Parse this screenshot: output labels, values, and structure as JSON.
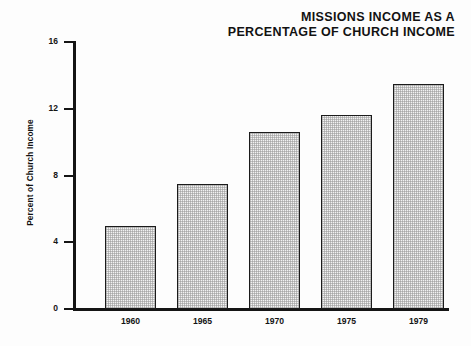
{
  "chart_data": {
    "type": "bar",
    "title": "MISSIONS INCOME AS A PERCENTAGE OF CHURCH INCOME",
    "title_lines": [
      "MISSIONS INCOME AS A",
      "PERCENTAGE OF CHURCH INCOME"
    ],
    "categories": [
      "1960",
      "1965",
      "1970",
      "1975",
      "1979"
    ],
    "values": [
      5.0,
      7.5,
      10.6,
      11.6,
      13.5
    ],
    "xlabel": "",
    "ylabel": "Percent of Church Income",
    "ylim": [
      0,
      16
    ],
    "yticks": [
      0,
      4,
      8,
      12,
      16
    ],
    "ytick_labels": [
      "0",
      "4",
      "8",
      "12",
      "16"
    ],
    "grid": false,
    "legend": false,
    "bar_fill_color": "#f2f2f2",
    "bar_edge_color": "#1b1b1b",
    "axis_color": "#151515",
    "background_color": "#fdfdfd"
  }
}
